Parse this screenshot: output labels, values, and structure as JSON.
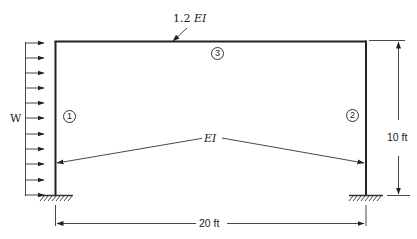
{
  "diagram": {
    "type": "portal-frame",
    "load": {
      "label": "W",
      "description": "uniform lateral load on left column",
      "arrow_count": 10
    },
    "members": [
      {
        "id": "1",
        "name": "left column",
        "stiffness_label": "EI"
      },
      {
        "id": "2",
        "name": "right column",
        "stiffness_label": "EI"
      },
      {
        "id": "3",
        "name": "beam",
        "stiffness_label": "1.2 EI"
      }
    ],
    "labels": {
      "beam_stiffness_num": "1.2",
      "beam_stiffness_sym": "EI",
      "column_stiffness": "EI",
      "member_1": "1",
      "member_2": "2",
      "member_3": "3",
      "height": "10 ft",
      "span": "20 ft",
      "load": "W"
    },
    "supports": {
      "left": "fixed",
      "right": "fixed"
    },
    "colors": {
      "line": "#222222",
      "background": "#ffffff"
    }
  }
}
